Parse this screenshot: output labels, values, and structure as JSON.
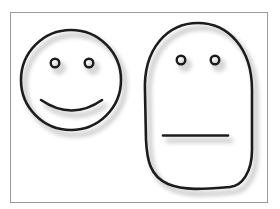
{
  "illustration": {
    "frame": {
      "stroke": "#9a9a9a"
    },
    "faces": [
      {
        "name": "smiling-face",
        "shape": "circle",
        "expression": "smile"
      },
      {
        "name": "neutral-face",
        "shape": "rounded-oblong",
        "expression": "neutral"
      }
    ],
    "colors": {
      "outline": "#1c1c1c",
      "shadow": "#b8b8b8",
      "background": "#ffffff"
    }
  }
}
